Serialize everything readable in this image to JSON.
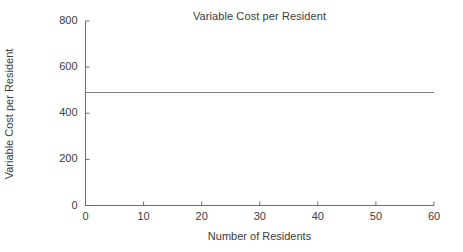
{
  "chart_data": {
    "type": "line",
    "title": "Variable Cost per Resident",
    "xlabel": "Number of Residents",
    "ylabel": "Variable Cost per Resident",
    "x": [
      0,
      60
    ],
    "series": [
      {
        "name": "Variable Cost per Resident",
        "values": [
          490,
          490
        ],
        "color": "#808080"
      }
    ],
    "xlim": [
      0,
      60
    ],
    "ylim": [
      0,
      800
    ],
    "xticks": [
      0,
      10,
      20,
      30,
      40,
      50,
      60
    ],
    "yticks": [
      0,
      200,
      400,
      600,
      800
    ],
    "xtick_labels": [
      "0",
      "10",
      "20",
      "30",
      "40",
      "50",
      "60"
    ],
    "ytick_labels": [
      "0",
      "200",
      "400",
      "600",
      "800"
    ],
    "grid": false,
    "legend": false,
    "legend_position": "none",
    "tick_direction": "in",
    "spines": [
      "left",
      "bottom"
    ],
    "annotations": [],
    "axis_color": "#6b6b6b",
    "text_color": "#3c3c3c",
    "background": "#ffffff"
  }
}
